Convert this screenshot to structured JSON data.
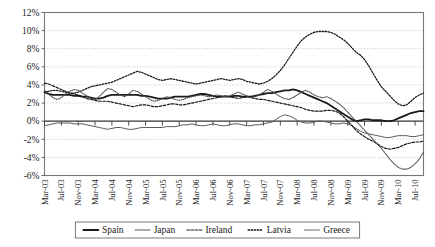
{
  "chart_data": {
    "type": "line",
    "title": "",
    "subtitle": "",
    "xlabel": "",
    "ylabel": "",
    "ylim": [
      -6,
      12
    ],
    "ytick_step": 2,
    "ytick_labels": [
      "12%",
      "10%",
      "8%",
      "6%",
      "4%",
      "2%",
      "0%",
      "-2%",
      "-4%",
      "-6%"
    ],
    "ytick_values": [
      12,
      10,
      8,
      6,
      4,
      2,
      0,
      -2,
      -4,
      -6
    ],
    "grid": true,
    "grid_style": "dotted-horizontal",
    "legend_position": "bottom",
    "x_tick_labels": [
      "Mar-03",
      "Jul-03",
      "Nov-03",
      "Mar-04",
      "Jul-04",
      "Nov-04",
      "Mar-05",
      "Jul-05",
      "Nov-05",
      "Mar-06",
      "Jul-06",
      "Nov-06",
      "Mar-07",
      "Jul-07",
      "Nov-07",
      "Mar-08",
      "Jul-08",
      "Nov-08",
      "Mar-09",
      "Jul-09",
      "Nov-09",
      "Mar-10",
      "Jul-10"
    ],
    "x_tick_interval_months": 4,
    "x_start": "Mar-03",
    "x_end": "Sep-10",
    "x_count": 91,
    "series": [
      {
        "name": "Spain",
        "style": "solid",
        "width": 1.8,
        "color": "#1a1a1a",
        "values": [
          3.2,
          3.0,
          2.9,
          2.9,
          2.9,
          2.9,
          2.9,
          2.8,
          2.8,
          2.7,
          2.7,
          2.6,
          2.5,
          2.5,
          2.6,
          2.8,
          2.9,
          2.9,
          2.9,
          2.9,
          2.9,
          2.9,
          2.9,
          2.8,
          2.8,
          2.7,
          2.6,
          2.5,
          2.5,
          2.5,
          2.6,
          2.7,
          2.7,
          2.7,
          2.7,
          2.8,
          2.9,
          3.0,
          3.0,
          2.9,
          2.8,
          2.7,
          2.7,
          2.7,
          2.7,
          2.8,
          2.8,
          2.7,
          2.7,
          2.7,
          2.8,
          2.9,
          3.0,
          3.1,
          3.1,
          3.2,
          3.3,
          3.4,
          3.4,
          3.5,
          3.4,
          3.2,
          3.0,
          2.8,
          2.6,
          2.4,
          2.2,
          2.0,
          1.7,
          1.4,
          1.1,
          0.8,
          0.5,
          0.2,
          0.0,
          0.1,
          0.2,
          0.2,
          0.1,
          0.1,
          0.1,
          0.0,
          0.0,
          0.1,
          0.3,
          0.5,
          0.7,
          0.9,
          1.0,
          1.1,
          1.1
        ]
      },
      {
        "name": "Japan",
        "style": "solid",
        "width": 1.0,
        "color": "#5a5a5a",
        "values": [
          -0.5,
          -0.4,
          -0.3,
          -0.2,
          -0.2,
          -0.2,
          -0.2,
          -0.3,
          -0.3,
          -0.3,
          -0.4,
          -0.5,
          -0.6,
          -0.7,
          -0.8,
          -0.9,
          -0.8,
          -0.7,
          -0.7,
          -0.8,
          -0.9,
          -0.9,
          -0.8,
          -0.7,
          -0.7,
          -0.7,
          -0.7,
          -0.7,
          -0.7,
          -0.6,
          -0.6,
          -0.6,
          -0.5,
          -0.4,
          -0.4,
          -0.3,
          -0.4,
          -0.5,
          -0.5,
          -0.4,
          -0.3,
          -0.4,
          -0.5,
          -0.5,
          -0.4,
          -0.3,
          -0.3,
          -0.4,
          -0.5,
          -0.5,
          -0.4,
          -0.4,
          -0.3,
          -0.2,
          -0.1,
          0.2,
          0.5,
          0.7,
          0.6,
          0.4,
          0.1,
          -0.1,
          -0.2,
          -0.2,
          -0.1,
          0.0,
          0.0,
          -0.1,
          -0.2,
          -0.3,
          -0.3,
          -0.2,
          -0.3,
          -0.5,
          -0.8,
          -1.1,
          -1.3,
          -1.4,
          -1.5,
          -1.6,
          -1.7,
          -1.8,
          -1.8,
          -1.7,
          -1.6,
          -1.6,
          -1.6,
          -1.7,
          -1.7,
          -1.6,
          -1.5
        ]
      },
      {
        "name": "Ireland",
        "style": "dashed",
        "width": 1.2,
        "color": "#1a1a1a",
        "values": [
          4.2,
          4.1,
          3.9,
          3.7,
          3.5,
          3.3,
          3.1,
          3.0,
          2.9,
          2.7,
          2.5,
          2.4,
          2.3,
          2.2,
          2.2,
          2.2,
          2.1,
          2.0,
          1.9,
          1.8,
          1.7,
          1.6,
          1.7,
          1.8,
          1.8,
          1.7,
          1.6,
          1.6,
          1.7,
          1.8,
          1.9,
          1.9,
          1.8,
          1.8,
          1.9,
          2.0,
          2.1,
          2.2,
          2.3,
          2.4,
          2.5,
          2.6,
          2.7,
          2.8,
          2.7,
          2.6,
          2.5,
          2.6,
          2.7,
          2.6,
          2.5,
          2.4,
          2.4,
          2.3,
          2.2,
          2.1,
          2.0,
          1.9,
          1.8,
          1.7,
          1.6,
          1.5,
          1.3,
          1.2,
          1.1,
          1.1,
          1.1,
          1.2,
          1.2,
          1.1,
          0.9,
          0.5,
          0.0,
          -0.5,
          -1.0,
          -1.4,
          -1.7,
          -2.0,
          -2.2,
          -2.5,
          -2.8,
          -3.0,
          -3.1,
          -3.0,
          -2.9,
          -2.7,
          -2.5,
          -2.4,
          -2.3,
          -2.3,
          -2.2
        ]
      },
      {
        "name": "Latvia",
        "style": "dotted-coarse",
        "width": 1.3,
        "color": "#1a1a1a",
        "values": [
          3.2,
          3.3,
          3.4,
          3.4,
          3.3,
          3.2,
          3.1,
          3.1,
          3.2,
          3.4,
          3.6,
          3.8,
          3.9,
          4.0,
          4.1,
          4.2,
          4.3,
          4.5,
          4.7,
          4.9,
          5.1,
          5.3,
          5.5,
          5.4,
          5.2,
          5.0,
          4.8,
          4.6,
          4.5,
          4.6,
          4.7,
          4.6,
          4.5,
          4.4,
          4.3,
          4.2,
          4.1,
          4.2,
          4.3,
          4.4,
          4.5,
          4.6,
          4.7,
          4.6,
          4.5,
          4.6,
          4.7,
          4.6,
          4.4,
          4.3,
          4.2,
          4.1,
          4.2,
          4.4,
          4.7,
          5.1,
          5.6,
          6.2,
          6.9,
          7.6,
          8.3,
          8.9,
          9.3,
          9.6,
          9.8,
          9.9,
          9.9,
          9.9,
          9.8,
          9.6,
          9.3,
          9.0,
          8.6,
          8.1,
          7.6,
          7.3,
          6.8,
          6.1,
          5.3,
          4.5,
          3.8,
          3.3,
          2.8,
          2.3,
          1.9,
          1.7,
          1.8,
          2.2,
          2.6,
          2.9,
          3.1
        ]
      },
      {
        "name": "Greece",
        "style": "dotted-fine",
        "width": 1.1,
        "color": "#4a4a4a",
        "values": [
          3.4,
          3.0,
          2.6,
          2.4,
          2.6,
          3.0,
          3.3,
          3.5,
          3.4,
          3.1,
          2.8,
          2.5,
          2.4,
          2.7,
          3.2,
          3.6,
          3.5,
          3.2,
          2.9,
          2.7,
          3.0,
          3.4,
          3.3,
          3.0,
          2.7,
          2.4,
          2.2,
          2.3,
          2.5,
          2.7,
          2.6,
          2.4,
          2.3,
          2.4,
          2.6,
          2.7,
          2.8,
          2.9,
          2.8,
          2.7,
          2.8,
          2.9,
          2.8,
          2.7,
          2.8,
          3.0,
          3.2,
          3.0,
          2.8,
          2.6,
          2.7,
          2.9,
          3.2,
          3.5,
          3.3,
          3.0,
          2.7,
          2.5,
          2.4,
          2.6,
          2.9,
          3.2,
          3.4,
          3.2,
          2.9,
          2.7,
          2.6,
          2.7,
          2.5,
          2.2,
          1.9,
          1.5,
          1.0,
          0.5,
          0.0,
          -0.5,
          -1.0,
          -1.5,
          -2.0,
          -2.5,
          -3.0,
          -3.6,
          -4.2,
          -4.7,
          -5.1,
          -5.3,
          -5.3,
          -5.1,
          -4.7,
          -4.2,
          -3.4
        ]
      }
    ],
    "legend": [
      {
        "label": "Spain",
        "style": "solid",
        "width": 1.8,
        "color": "#1a1a1a"
      },
      {
        "label": "Japan",
        "style": "solid",
        "width": 1.0,
        "color": "#5a5a5a"
      },
      {
        "label": "Ireland",
        "style": "dashed",
        "width": 1.2,
        "color": "#1a1a1a"
      },
      {
        "label": "Latvia",
        "style": "dotted-coarse",
        "width": 1.3,
        "color": "#1a1a1a"
      },
      {
        "label": "Greece",
        "style": "dotted-fine",
        "width": 1.1,
        "color": "#4a4a4a"
      }
    ]
  },
  "colors": {
    "background": "#ffffff",
    "axis": "#555555",
    "frame": "#777777",
    "grid": "#b9b9b9",
    "text": "#1a1a1a"
  }
}
